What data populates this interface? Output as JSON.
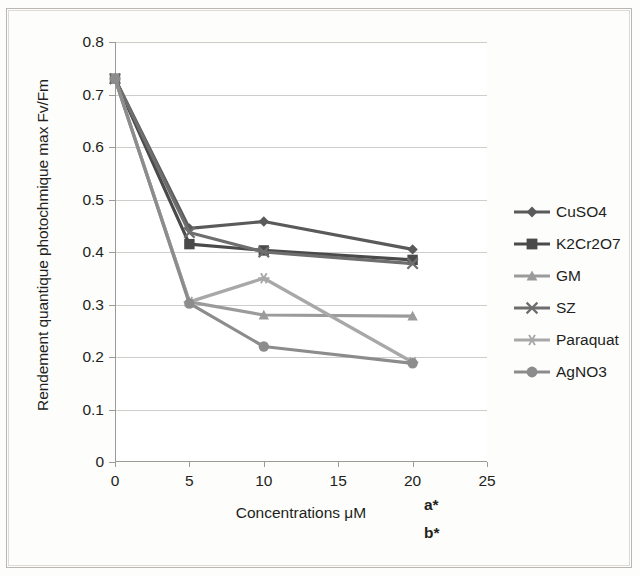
{
  "figure": {
    "background": "#fdfdfc",
    "plot_background": "#ffffff"
  },
  "annotations": {
    "a": "a*",
    "b": "b*"
  },
  "legend": {
    "position": "right",
    "entries": [
      {
        "label": "CuSO4",
        "marker": "diamond",
        "color": "#5a5a5a"
      },
      {
        "label": "K2Cr2O7",
        "marker": "square",
        "color": "#4a4a4a"
      },
      {
        "label": "GM",
        "marker": "triangle",
        "color": "#9b9b9b"
      },
      {
        "label": "SZ",
        "marker": "x",
        "color": "#6e6e6e"
      },
      {
        "label": "Paraquat",
        "marker": "asterisk",
        "color": "#a8a8a8"
      },
      {
        "label": "AgNO3",
        "marker": "circle",
        "color": "#8c8c8c"
      }
    ]
  },
  "chart_data": {
    "type": "line",
    "title": "",
    "xlabel": "Concentrations  μM",
    "ylabel": "Rendement quantique photochmique max Fv/Fm",
    "xlim": [
      0,
      25
    ],
    "ylim": [
      0,
      0.8
    ],
    "xticks": [
      0,
      5,
      10,
      15,
      20,
      25
    ],
    "xtick_labels": [
      "0",
      "5",
      "10",
      "15",
      "20",
      "25"
    ],
    "yticks": [
      0,
      0.1,
      0.2,
      0.3,
      0.4,
      0.5,
      0.6,
      0.7,
      0.8
    ],
    "ytick_labels": [
      "0",
      "0.1",
      "0.2",
      "0.3",
      "0.4",
      "0.5",
      "0.6",
      "0.7",
      "0.8"
    ],
    "grid": "horizontal",
    "x": [
      0,
      5,
      10,
      20
    ],
    "series": [
      {
        "name": "CuSO4",
        "marker": "diamond",
        "color": "#5a5a5a",
        "values": [
          0.73,
          0.445,
          0.458,
          0.405
        ]
      },
      {
        "name": "K2Cr2O7",
        "marker": "square",
        "color": "#4a4a4a",
        "values": [
          0.73,
          0.415,
          0.403,
          0.385
        ]
      },
      {
        "name": "GM",
        "marker": "triangle",
        "color": "#9b9b9b",
        "values": [
          0.73,
          0.305,
          0.28,
          0.278
        ]
      },
      {
        "name": "SZ",
        "marker": "x",
        "color": "#6e6e6e",
        "values": [
          0.73,
          0.437,
          0.4,
          0.378
        ]
      },
      {
        "name": "Paraquat",
        "marker": "asterisk",
        "color": "#a8a8a8",
        "values": [
          0.73,
          0.305,
          0.35,
          0.19
        ]
      },
      {
        "name": "AgNO3",
        "marker": "circle",
        "color": "#8c8c8c",
        "values": [
          0.73,
          0.302,
          0.22,
          0.188
        ]
      }
    ]
  }
}
